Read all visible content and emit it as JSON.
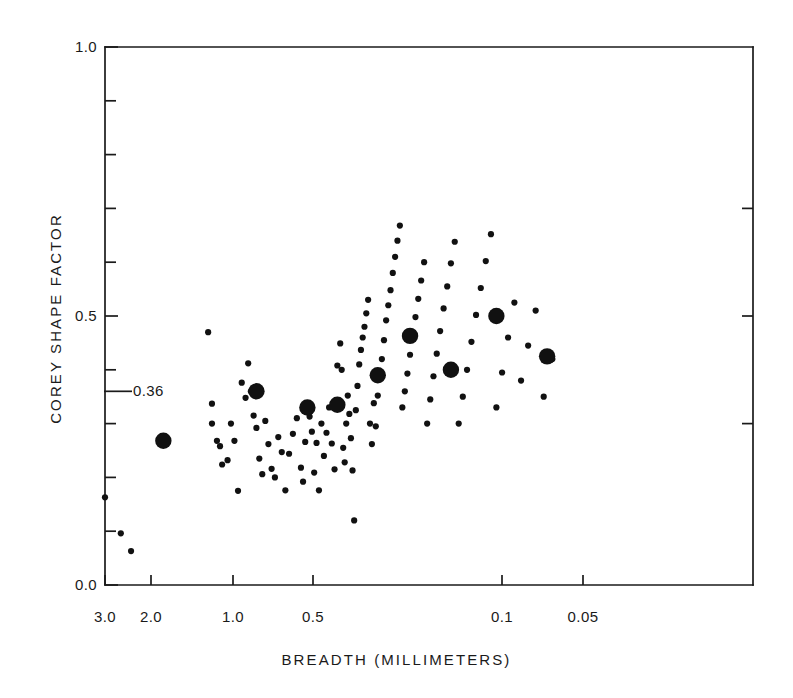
{
  "figure": {
    "background_color": "#ffffff",
    "ink_color": "#1a1a1a",
    "width": 793,
    "height": 698
  },
  "chart_data": {
    "type": "scatter",
    "title": "",
    "xlabel": "BREADTH (MILLIMETERS)",
    "ylabel": "COREY SHAPE FACTOR",
    "xscale": "log-reversed",
    "xlim": [
      3.0,
      0.05
    ],
    "ylim": [
      0.0,
      1.0
    ],
    "grid": false,
    "legend": null,
    "xticks": [
      {
        "value": 3.0,
        "label": "3.0",
        "px": 105
      },
      {
        "value": 2.0,
        "label": "2.0",
        "px": 151
      },
      {
        "value": 1.0,
        "label": "1.0",
        "px": 233
      },
      {
        "value": 0.5,
        "label": "0.5",
        "px": 313
      },
      {
        "value": 0.1,
        "label": "0.1",
        "px": 502
      },
      {
        "value": 0.05,
        "label": "0.05",
        "px": 583
      }
    ],
    "xminor_ticks_px": [],
    "yticks_major": [
      {
        "value": 0.0,
        "label": "0.0"
      },
      {
        "value": 0.5,
        "label": "0.5"
      },
      {
        "value": 1.0,
        "label": "1.0"
      }
    ],
    "yticks_minor": [
      0.1,
      0.2,
      0.3,
      0.4,
      0.6,
      0.7,
      0.8,
      0.9
    ],
    "annotations": [
      {
        "name": "mean-shape-factor",
        "label": "0.36",
        "y_value": 0.36,
        "leader_line": true
      }
    ],
    "series": [
      {
        "name": "individual-grains",
        "marker": "small-filled-circle",
        "marker_radius_px": 3.1,
        "color": "#111111",
        "points": [
          [
            3.0,
            0.163
          ],
          [
            2.62,
            0.096
          ],
          [
            2.4,
            0.063
          ],
          [
            1.24,
            0.47
          ],
          [
            1.2,
            0.337
          ],
          [
            1.2,
            0.3
          ],
          [
            1.15,
            0.268
          ],
          [
            1.12,
            0.258
          ],
          [
            1.1,
            0.224
          ],
          [
            1.05,
            0.232
          ],
          [
            1.02,
            0.3
          ],
          [
            0.99,
            0.268
          ],
          [
            0.96,
            0.175
          ],
          [
            0.93,
            0.376
          ],
          [
            0.9,
            0.348
          ],
          [
            0.88,
            0.412
          ],
          [
            0.86,
            0.36
          ],
          [
            0.84,
            0.315
          ],
          [
            0.82,
            0.292
          ],
          [
            0.8,
            0.235
          ],
          [
            0.78,
            0.206
          ],
          [
            0.76,
            0.305
          ],
          [
            0.74,
            0.262
          ],
          [
            0.72,
            0.216
          ],
          [
            0.7,
            0.2
          ],
          [
            0.68,
            0.275
          ],
          [
            0.66,
            0.247
          ],
          [
            0.64,
            0.176
          ],
          [
            0.62,
            0.244
          ],
          [
            0.6,
            0.281
          ],
          [
            0.58,
            0.31
          ],
          [
            0.56,
            0.218
          ],
          [
            0.55,
            0.192
          ],
          [
            0.54,
            0.266
          ],
          [
            0.52,
            0.313
          ],
          [
            0.51,
            0.285
          ],
          [
            0.5,
            0.209
          ],
          [
            0.49,
            0.264
          ],
          [
            0.48,
            0.176
          ],
          [
            0.47,
            0.3
          ],
          [
            0.46,
            0.24
          ],
          [
            0.45,
            0.283
          ],
          [
            0.44,
            0.33
          ],
          [
            0.43,
            0.263
          ],
          [
            0.42,
            0.215
          ],
          [
            0.41,
            0.408
          ],
          [
            0.4,
            0.449
          ],
          [
            0.395,
            0.4
          ],
          [
            0.39,
            0.255
          ],
          [
            0.385,
            0.228
          ],
          [
            0.38,
            0.3
          ],
          [
            0.375,
            0.352
          ],
          [
            0.37,
            0.318
          ],
          [
            0.365,
            0.273
          ],
          [
            0.36,
            0.213
          ],
          [
            0.355,
            0.12
          ],
          [
            0.35,
            0.325
          ],
          [
            0.345,
            0.37
          ],
          [
            0.34,
            0.41
          ],
          [
            0.335,
            0.437
          ],
          [
            0.33,
            0.46
          ],
          [
            0.325,
            0.48
          ],
          [
            0.32,
            0.505
          ],
          [
            0.315,
            0.53
          ],
          [
            0.31,
            0.3
          ],
          [
            0.305,
            0.262
          ],
          [
            0.3,
            0.338
          ],
          [
            0.295,
            0.295
          ],
          [
            0.29,
            0.352
          ],
          [
            0.285,
            0.383
          ],
          [
            0.28,
            0.42
          ],
          [
            0.275,
            0.455
          ],
          [
            0.27,
            0.492
          ],
          [
            0.265,
            0.52
          ],
          [
            0.26,
            0.548
          ],
          [
            0.255,
            0.58
          ],
          [
            0.25,
            0.61
          ],
          [
            0.245,
            0.64
          ],
          [
            0.24,
            0.668
          ],
          [
            0.235,
            0.33
          ],
          [
            0.23,
            0.36
          ],
          [
            0.225,
            0.393
          ],
          [
            0.22,
            0.428
          ],
          [
            0.215,
            0.463
          ],
          [
            0.21,
            0.498
          ],
          [
            0.205,
            0.532
          ],
          [
            0.2,
            0.566
          ],
          [
            0.195,
            0.6
          ],
          [
            0.19,
            0.3
          ],
          [
            0.185,
            0.345
          ],
          [
            0.18,
            0.388
          ],
          [
            0.175,
            0.43
          ],
          [
            0.17,
            0.472
          ],
          [
            0.165,
            0.514
          ],
          [
            0.16,
            0.555
          ],
          [
            0.155,
            0.598
          ],
          [
            0.15,
            0.638
          ],
          [
            0.145,
            0.3
          ],
          [
            0.14,
            0.35
          ],
          [
            0.135,
            0.4
          ],
          [
            0.13,
            0.452
          ],
          [
            0.125,
            0.502
          ],
          [
            0.12,
            0.552
          ],
          [
            0.115,
            0.602
          ],
          [
            0.11,
            0.652
          ],
          [
            0.105,
            0.33
          ],
          [
            0.1,
            0.395
          ],
          [
            0.095,
            0.46
          ],
          [
            0.09,
            0.525
          ],
          [
            0.085,
            0.38
          ],
          [
            0.08,
            0.445
          ],
          [
            0.075,
            0.51
          ],
          [
            0.07,
            0.35
          ],
          [
            0.065,
            0.42
          ]
        ]
      },
      {
        "name": "size-class-means",
        "marker": "large-filled-circle",
        "marker_radius_px": 8.2,
        "color": "#111111",
        "points": [
          [
            1.82,
            0.268
          ],
          [
            0.82,
            0.36
          ],
          [
            0.53,
            0.33
          ],
          [
            0.41,
            0.335
          ],
          [
            0.29,
            0.39
          ],
          [
            0.22,
            0.463
          ],
          [
            0.155,
            0.4
          ],
          [
            0.105,
            0.5
          ],
          [
            0.068,
            0.425
          ]
        ]
      }
    ]
  }
}
